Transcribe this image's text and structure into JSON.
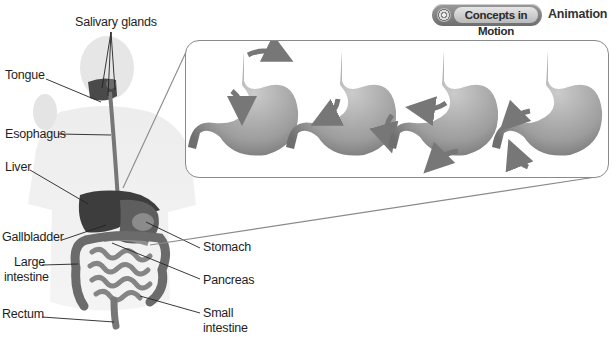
{
  "header": {
    "badge_label": "Concepts in Motion",
    "badge_icon": "concentric-circle-icon",
    "caption": "Animation"
  },
  "figure": {
    "labels_left": [
      {
        "id": "tongue",
        "text": "Tongue"
      },
      {
        "id": "esophagus",
        "text": "Esophagus"
      },
      {
        "id": "liver",
        "text": "Liver"
      },
      {
        "id": "gallbladder",
        "text": "Gallbladder"
      },
      {
        "id": "large-intestine-1",
        "text": "Large"
      },
      {
        "id": "large-intestine-2",
        "text": "intestine"
      },
      {
        "id": "rectum",
        "text": "Rectum"
      }
    ],
    "labels_top": [
      {
        "id": "salivary-glands",
        "text": "Salivary glands"
      }
    ],
    "labels_right": [
      {
        "id": "stomach",
        "text": "Stomach"
      },
      {
        "id": "pancreas",
        "text": "Pancreas"
      },
      {
        "id": "small-intestine-1",
        "text": "Small"
      },
      {
        "id": "small-intestine-2",
        "text": "intestine"
      }
    ]
  },
  "inset": {
    "description": "Stomach peristalsis sequence",
    "frames": [
      {
        "index": 1,
        "arrows": [
          "top-right curve",
          "left down curve"
        ]
      },
      {
        "index": 2,
        "arrows": [
          "left down-left curve",
          "right down curve"
        ]
      },
      {
        "index": 3,
        "arrows": [
          "upper left",
          "bottom left"
        ]
      },
      {
        "index": 4,
        "arrows": [
          "left toward pylorus",
          "bottom up-left"
        ]
      }
    ]
  },
  "colors": {
    "organ_dark": "#3a3a3a",
    "organ_mid": "#7a7a7a",
    "stomach_fill": "#9c9c9c",
    "body_silhouette": "#ececec",
    "leader_line": "#222222",
    "inset_border": "#8a8a8a"
  }
}
